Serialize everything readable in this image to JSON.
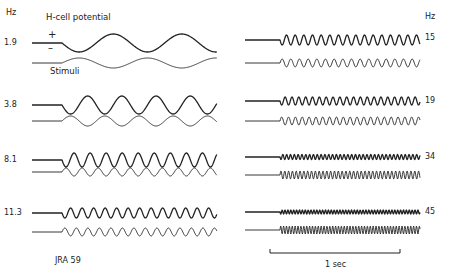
{
  "chart_data": {
    "type": "line",
    "title": "",
    "units_label": "Hz",
    "trace_labels": {
      "response": "H-cell potential",
      "stimulus": "Stimuli",
      "polarity_plus": "+",
      "polarity_minus": "–"
    },
    "scale_bar": {
      "label": "1 sec",
      "duration_s": 1
    },
    "specimen_label": "JRA 59",
    "left_column_frequencies_hz": [
      1.9,
      3.8,
      8.1,
      11.3
    ],
    "right_column_frequencies_hz": [
      15,
      19,
      34,
      45
    ],
    "series": [
      {
        "name": "1.9 Hz",
        "label": "1.9",
        "freq_hz": 1.9,
        "column": "left",
        "resp_amp": 9,
        "stim_amp": 5
      },
      {
        "name": "3.8 Hz",
        "label": "3.8",
        "freq_hz": 3.8,
        "column": "left",
        "resp_amp": 9,
        "stim_amp": 5
      },
      {
        "name": "8.1 Hz",
        "label": "8.1",
        "freq_hz": 8.1,
        "column": "left",
        "resp_amp": 7,
        "stim_amp": 4
      },
      {
        "name": "11.3 Hz",
        "label": "11.3",
        "freq_hz": 11.3,
        "column": "left",
        "resp_amp": 5,
        "stim_amp": 4
      },
      {
        "name": "15 Hz",
        "label": "15",
        "freq_hz": 15,
        "column": "right",
        "resp_amp": 5,
        "stim_amp": 4
      },
      {
        "name": "19 Hz",
        "label": "19",
        "freq_hz": 19,
        "column": "right",
        "resp_amp": 4,
        "stim_amp": 4
      },
      {
        "name": "34 Hz",
        "label": "34",
        "freq_hz": 34,
        "column": "right",
        "resp_amp": 2.5,
        "stim_amp": 4
      },
      {
        "name": "45 Hz",
        "label": "45",
        "freq_hz": 45,
        "column": "right",
        "resp_amp": 2,
        "stim_amp": 4
      }
    ],
    "grid": false,
    "legend": "none"
  },
  "labels": {
    "hz_left": "Hz",
    "hz_right": "Hz",
    "response": "H-cell potential",
    "stimulus": "Stimuli",
    "plus": "+",
    "minus": "–",
    "specimen": "JRA 59",
    "scale": "1 sec",
    "f_1_9": "1.9",
    "f_3_8": "3.8",
    "f_8_1": "8.1",
    "f_11_3": "11.3",
    "f_15": "15",
    "f_19": "19",
    "f_34": "34",
    "f_45": "45"
  },
  "colors": {
    "ink": "#222222",
    "background": "#ffffff"
  }
}
